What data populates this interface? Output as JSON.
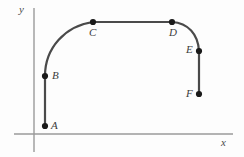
{
  "figure": {
    "title": "",
    "background_color": "#fdfdfd",
    "axis_color": "#9a9a9a",
    "curve_color": "#4a4a4a",
    "point_color": "#1a1a1a",
    "label_color": "#3c3c3c"
  },
  "axes": {
    "x_axis_label": "x",
    "y_axis_label": "y",
    "x_axis": {
      "y": 134,
      "x_start": 14,
      "x_end": 233
    },
    "y_axis": {
      "x": 34,
      "y_start": 8,
      "y_end": 152
    }
  },
  "chart_data": {
    "type": "line",
    "title": "",
    "xlabel": "x",
    "ylabel": "y",
    "grid": false,
    "legend": "none",
    "axis_style": "open",
    "points": [
      {
        "name": "A",
        "x": 45,
        "y": 126,
        "label_offset_x": 6,
        "label_offset_y": -6
      },
      {
        "name": "B",
        "x": 45,
        "y": 76,
        "label_offset_x": 7,
        "label_offset_y": -6
      },
      {
        "name": "C",
        "x": 93,
        "y": 22,
        "label_offset_x": -4,
        "label_offset_y": 5
      },
      {
        "name": "D",
        "x": 172,
        "y": 22,
        "label_offset_x": -3,
        "label_offset_y": 5
      },
      {
        "name": "E",
        "x": 199,
        "y": 51,
        "label_offset_x": -13,
        "label_offset_y": -7
      },
      {
        "name": "F",
        "x": 199,
        "y": 94,
        "label_offset_x": -13,
        "label_offset_y": -6
      }
    ],
    "segments": [
      {
        "from": "A",
        "to": "B",
        "kind": "line"
      },
      {
        "from": "B",
        "to": "C",
        "kind": "arc",
        "corner_x": 45,
        "corner_y": 22
      },
      {
        "from": "C",
        "to": "D",
        "kind": "line"
      },
      {
        "from": "D",
        "to": "E",
        "kind": "arc",
        "corner_x": 199,
        "corner_y": 22
      },
      {
        "from": "E",
        "to": "F",
        "kind": "line"
      }
    ],
    "path_d": "M 45 126 L 45 76 C 45 48 65 26 93 22 L 172 22 C 188 23 198 34 199 51 L 199 94"
  }
}
